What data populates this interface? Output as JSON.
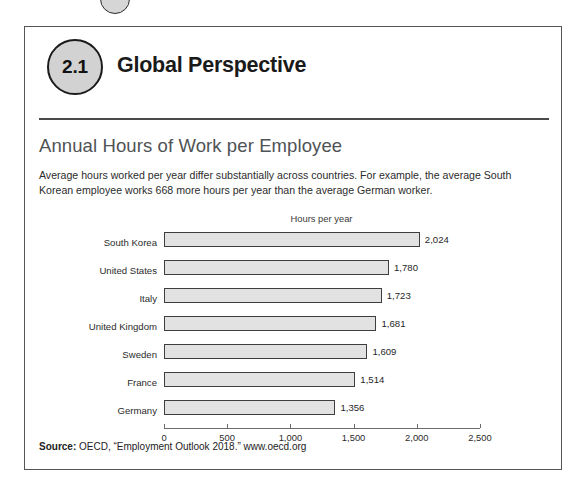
{
  "section": {
    "number": "2.1",
    "heading": "Global Perspective"
  },
  "figure": {
    "title": "Annual Hours of Work per Employee",
    "description": "Average hours worked per year differ substantially across countries. For example, the average South Korean employee works 668 more hours per year than the average German worker."
  },
  "source": {
    "label": "Source:",
    "text": "OECD, “Employment Outlook 2018.” www.oecd.org"
  },
  "chart_data": {
    "type": "bar",
    "orientation": "horizontal",
    "title": "Annual Hours of Work per Employee",
    "subtitle": "Hours per year",
    "xlabel": "Hours per year",
    "ylabel": "",
    "xlim": [
      0,
      2500
    ],
    "grid": false,
    "legend": false,
    "categories": [
      "South Korea",
      "United States",
      "Italy",
      "United Kingdom",
      "Sweden",
      "France",
      "Germany"
    ],
    "values": [
      2024,
      1780,
      1723,
      1681,
      1609,
      1514,
      1356
    ],
    "value_labels": [
      "2,024",
      "1,780",
      "1,723",
      "1,681",
      "1,609",
      "1,514",
      "1,356"
    ],
    "xticks": [
      0,
      500,
      1000,
      1500,
      2000,
      2500
    ],
    "xtick_labels": [
      "0",
      "500",
      "1,000",
      "1,500",
      "2,000",
      "2,500"
    ],
    "bar_fill_color": "#e2e2e2",
    "bar_border_color": "#3e3e3e"
  }
}
